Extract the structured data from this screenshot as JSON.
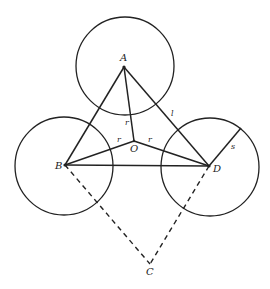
{
  "diagram": {
    "type": "geometry",
    "points": {
      "A": {
        "label": "A",
        "x": 124,
        "y": 67
      },
      "B": {
        "label": "B",
        "x": 65,
        "y": 165
      },
      "D": {
        "label": "D",
        "x": 209,
        "y": 166
      },
      "O": {
        "label": "O",
        "x": 134,
        "y": 141
      },
      "C": {
        "label": "C",
        "x": 150,
        "y": 264
      }
    },
    "circles": [
      {
        "center": "A",
        "cx": 125,
        "cy": 66,
        "r": 49
      },
      {
        "center": "B",
        "cx": 64,
        "cy": 166,
        "r": 49
      },
      {
        "center": "D",
        "cx": 210,
        "cy": 167,
        "r": 49
      }
    ],
    "segments": {
      "AB": {
        "style": "solid"
      },
      "AD": {
        "style": "solid",
        "label": "l"
      },
      "BD": {
        "style": "solid"
      },
      "AO": {
        "style": "solid",
        "label": "r"
      },
      "BO": {
        "style": "solid",
        "label": "r"
      },
      "DO": {
        "style": "solid",
        "label": "r"
      },
      "BC": {
        "style": "dashed"
      },
      "DC": {
        "style": "dashed"
      },
      "D_radius": {
        "style": "solid",
        "label": "s"
      }
    },
    "labels": {
      "A": "A",
      "B": "B",
      "C": "C",
      "D": "D",
      "O": "O",
      "l": "l",
      "s": "s",
      "r_AO": "r",
      "r_BO": "r",
      "r_DO": "r"
    }
  }
}
